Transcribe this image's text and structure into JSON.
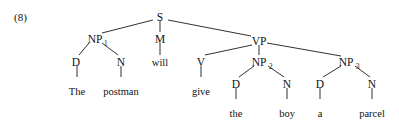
{
  "figure": {
    "example_number": "(8)",
    "sentence": "The postman will give the boy a parcel"
  },
  "tree": {
    "nodes": {
      "s": {
        "label": "S",
        "sub": "",
        "x": 160,
        "y": 17
      },
      "np1": {
        "label": "NP",
        "sub": "1",
        "x": 95,
        "y": 39
      },
      "m": {
        "label": "M",
        "sub": "",
        "x": 160,
        "y": 39
      },
      "vp": {
        "label": "VP",
        "sub": "",
        "x": 259,
        "y": 41
      },
      "d1": {
        "label": "D",
        "sub": "",
        "x": 76,
        "y": 62
      },
      "n1": {
        "label": "N",
        "sub": "",
        "x": 121,
        "y": 62
      },
      "v": {
        "label": "V",
        "sub": "",
        "x": 201,
        "y": 62
      },
      "np2": {
        "label": "NP",
        "sub": "2",
        "x": 261,
        "y": 62
      },
      "np3": {
        "label": "NP",
        "sub": "3",
        "x": 348,
        "y": 62
      },
      "d2": {
        "label": "D",
        "sub": "",
        "x": 236,
        "y": 84
      },
      "n2": {
        "label": "N",
        "sub": "",
        "x": 287,
        "y": 84
      },
      "d3": {
        "label": "D",
        "sub": "",
        "x": 320,
        "y": 84
      },
      "n3": {
        "label": "N",
        "sub": "",
        "x": 372,
        "y": 84
      }
    },
    "leaves": {
      "the1": {
        "text": "The",
        "x": 77,
        "y": 95
      },
      "postman": {
        "text": "postman",
        "x": 121,
        "y": 95
      },
      "will": {
        "text": "will",
        "x": 160,
        "y": 62
      },
      "give": {
        "text": "give",
        "x": 201,
        "y": 95
      },
      "the2": {
        "text": "the",
        "x": 236,
        "y": 117
      },
      "boy": {
        "text": "boy",
        "x": 287,
        "y": 117
      },
      "a": {
        "text": "a",
        "x": 320,
        "y": 117
      },
      "parcel": {
        "text": "parcel",
        "x": 372,
        "y": 117
      }
    },
    "edges": [
      {
        "name": "edge-s-np1",
        "from": "S",
        "to": "NP1",
        "x1": 153,
        "y1": 20,
        "x2": 102,
        "y2": 33
      },
      {
        "name": "edge-s-m",
        "from": "S",
        "to": "M",
        "x1": 160,
        "y1": 21,
        "x2": 160,
        "y2": 32
      },
      {
        "name": "edge-s-vp",
        "from": "S",
        "to": "VP",
        "x1": 168,
        "y1": 20,
        "x2": 251,
        "y2": 36
      },
      {
        "name": "edge-np1-d1",
        "from": "NP1",
        "to": "D",
        "x1": 89,
        "y1": 43,
        "x2": 79,
        "y2": 55
      },
      {
        "name": "edge-np1-n1",
        "from": "NP1",
        "to": "N",
        "x1": 102,
        "y1": 43,
        "x2": 118,
        "y2": 55
      },
      {
        "name": "edge-m-will",
        "from": "M",
        "to": "will",
        "x1": 160,
        "y1": 43,
        "x2": 160,
        "y2": 55
      },
      {
        "name": "edge-vp-v",
        "from": "VP",
        "to": "V",
        "x1": 252,
        "y1": 45,
        "x2": 205,
        "y2": 55
      },
      {
        "name": "edge-vp-np2",
        "from": "VP",
        "to": "NP2",
        "x1": 259,
        "y1": 45,
        "x2": 259,
        "y2": 55
      },
      {
        "name": "edge-vp-np3",
        "from": "VP",
        "to": "NP3",
        "x1": 267,
        "y1": 43,
        "x2": 341,
        "y2": 56
      },
      {
        "name": "edge-d1-the",
        "from": "D",
        "to": "The",
        "x1": 77,
        "y1": 66,
        "x2": 77,
        "y2": 77
      },
      {
        "name": "edge-n1-pos",
        "from": "N",
        "to": "postman",
        "x1": 121,
        "y1": 66,
        "x2": 121,
        "y2": 77
      },
      {
        "name": "edge-v-give",
        "from": "V",
        "to": "give",
        "x1": 201,
        "y1": 66,
        "x2": 201,
        "y2": 77
      },
      {
        "name": "edge-np2-d2",
        "from": "NP2",
        "to": "D",
        "x1": 254,
        "y1": 66,
        "x2": 239,
        "y2": 77
      },
      {
        "name": "edge-np2-n2",
        "from": "NP2",
        "to": "N",
        "x1": 268,
        "y1": 66,
        "x2": 284,
        "y2": 77
      },
      {
        "name": "edge-np3-d3",
        "from": "NP3",
        "to": "D",
        "x1": 341,
        "y1": 66,
        "x2": 323,
        "y2": 77
      },
      {
        "name": "edge-np3-n3",
        "from": "NP3",
        "to": "N",
        "x1": 355,
        "y1": 66,
        "x2": 370,
        "y2": 77
      },
      {
        "name": "edge-d2-the",
        "from": "D",
        "to": "the",
        "x1": 236,
        "y1": 88,
        "x2": 236,
        "y2": 99
      },
      {
        "name": "edge-n2-boy",
        "from": "N",
        "to": "boy",
        "x1": 287,
        "y1": 88,
        "x2": 287,
        "y2": 99
      },
      {
        "name": "edge-d3-a",
        "from": "D",
        "to": "a",
        "x1": 320,
        "y1": 88,
        "x2": 320,
        "y2": 99
      },
      {
        "name": "edge-n3-par",
        "from": "N",
        "to": "parcel",
        "x1": 372,
        "y1": 88,
        "x2": 372,
        "y2": 99
      }
    ]
  },
  "example_label_pos": {
    "x": 14,
    "y": 21
  }
}
